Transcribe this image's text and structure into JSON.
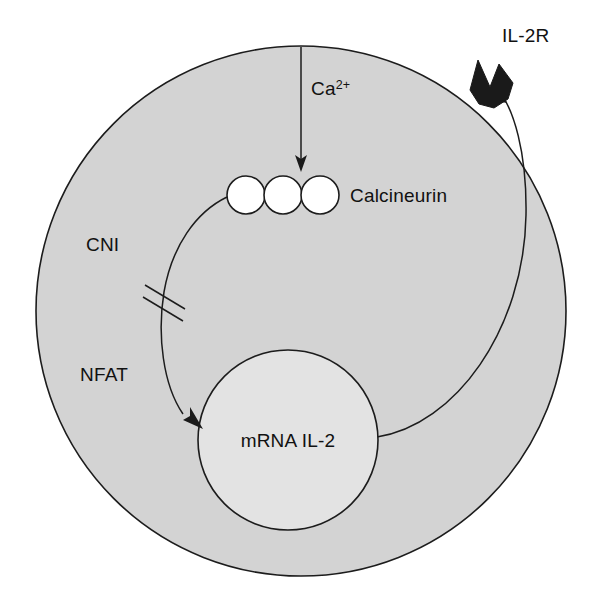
{
  "diagram": {
    "canvas": {
      "width": 601,
      "height": 602,
      "background": "#ffffff"
    },
    "colors": {
      "cytoplasm_fill": "#d3d3d3",
      "nucleus_fill": "#e3e3e3",
      "protein_fill": "#ffffff",
      "receptor_fill": "#1a1a1a",
      "stroke": "#1c1c1c",
      "text": "#111111"
    },
    "cell": {
      "name": "cell-body",
      "center_x": 301,
      "center_y": 311,
      "radius": 265
    },
    "nucleus": {
      "name": "nucleus",
      "center_x": 288,
      "center_y": 440,
      "radius": 90,
      "label": "mRNA IL-2"
    },
    "calcineurin": {
      "label": "Calcineurin",
      "subunit_count": 3,
      "subunit_radius": 19,
      "subunit_centers_x": [
        246,
        283,
        320
      ],
      "subunit_center_y": 195
    },
    "calcium": {
      "label_main": "Ca",
      "label_superscript": "2+",
      "arrow_from_y": 47,
      "arrow_to_y": 170,
      "arrow_x": 301
    },
    "cni": {
      "label": "CNI",
      "block_marks": 2,
      "description": "double slash inhibition mark on NFAT pathway"
    },
    "nfat": {
      "label": "NFAT",
      "description": "curved arrow from calcineurin to nucleus"
    },
    "il2r": {
      "label": "IL-2R",
      "description": "black notched receptor embedded in membrane at upper right",
      "anchor_x": 492,
      "anchor_y": 85
    },
    "feedback_arrow": {
      "description": "curve from nucleus right edge up to IL-2 receptor"
    }
  }
}
